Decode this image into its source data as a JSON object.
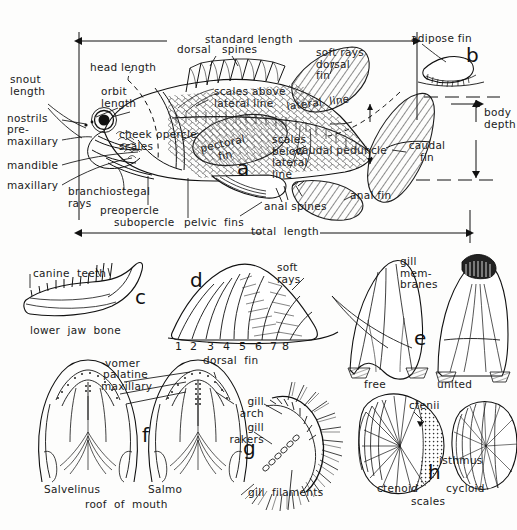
{
  "figure": {
    "ink_color": "#111111",
    "background_color": "#fdfdfc"
  },
  "panel_a": {
    "letter": "a",
    "measurements": [
      {
        "name": "standard-length",
        "label": "standard length"
      },
      {
        "name": "total-length",
        "label": "total  length"
      },
      {
        "name": "body-depth",
        "label": "body\ndepth"
      },
      {
        "name": "head-length",
        "label": "head length"
      },
      {
        "name": "snout-length",
        "label": "snout\nlength"
      },
      {
        "name": "orbit-length",
        "label": "orbit\nlength"
      }
    ],
    "labels": [
      {
        "name": "dorsal-spines",
        "label": "dorsal   spines"
      },
      {
        "name": "soft-rays-dorsal-fin",
        "label": "soft rays\ndorsal\nfin"
      },
      {
        "name": "adipose-fin",
        "label": "adipose fin"
      },
      {
        "name": "scales-above-lateral-line",
        "label": "scales above\nlateral line"
      },
      {
        "name": "lateral-line",
        "label": "lateral  line"
      },
      {
        "name": "scales-below-lateral-line",
        "label": "scales\nbelow\nlateral\nline"
      },
      {
        "name": "caudal-peduncle",
        "label": "caudal peduncle"
      },
      {
        "name": "caudal-fin",
        "label": "caudal\nfin"
      },
      {
        "name": "anal-fin",
        "label": "anal fin"
      },
      {
        "name": "anal-spines",
        "label": "anal spines"
      },
      {
        "name": "pelvic-fins",
        "label": "pelvic  fins"
      },
      {
        "name": "pectoral-fin",
        "label": "pectoral\nfin"
      },
      {
        "name": "nostrils",
        "label": "nostrils"
      },
      {
        "name": "premaxillary",
        "label": "pre-\nmaxillary"
      },
      {
        "name": "mandible",
        "label": "mandible"
      },
      {
        "name": "maxillary",
        "label": "maxillary"
      },
      {
        "name": "branchiostegal-rays",
        "label": "branchiostegal\nrays"
      },
      {
        "name": "preopercle",
        "label": "preopercle"
      },
      {
        "name": "subopercle",
        "label": "subopercle"
      },
      {
        "name": "cheek-scales",
        "label": "cheek\nscales"
      },
      {
        "name": "opercle",
        "label": "opercle"
      }
    ]
  },
  "panel_b": {
    "letter": "b",
    "subject": "adipose fin"
  },
  "panel_c": {
    "letter": "c",
    "labels": [
      {
        "name": "canine-teeth",
        "label": "canine  teeth"
      },
      {
        "name": "lower-jaw-bone",
        "label": "lower  jaw  bone"
      }
    ]
  },
  "panel_d": {
    "letter": "d",
    "labels": [
      {
        "name": "soft-rays",
        "label": "soft\nrays"
      },
      {
        "name": "dorsal-fin",
        "label": "dorsal  fin"
      }
    ],
    "ray_numbers": [
      "1",
      "2",
      "3",
      "4",
      "5",
      "6",
      "7",
      "8"
    ]
  },
  "panel_e": {
    "letter": "e",
    "labels": [
      {
        "name": "gill-membranes",
        "label": "gill\nmem-\nbranes"
      },
      {
        "name": "isthmus",
        "label": "isthmus"
      },
      {
        "name": "free",
        "label": "free"
      },
      {
        "name": "united",
        "label": "united"
      }
    ]
  },
  "panel_f": {
    "letter": "f",
    "labels": [
      {
        "name": "vomer",
        "label": "vomer"
      },
      {
        "name": "palatine",
        "label": "palatine"
      },
      {
        "name": "maxillary",
        "label": "maxillary"
      },
      {
        "name": "salvelinus",
        "label": "Salvelinus"
      },
      {
        "name": "salmo",
        "label": "Salmo"
      },
      {
        "name": "roof-of-mouth",
        "label": "roof  of  mouth"
      }
    ]
  },
  "panel_g": {
    "letter": "g",
    "labels": [
      {
        "name": "gill-arch",
        "label": "gill\narch"
      },
      {
        "name": "gill-rakers",
        "label": "gill\nrakers"
      },
      {
        "name": "gill-filaments",
        "label": "gill  filaments"
      }
    ]
  },
  "panel_h": {
    "letter": "h",
    "labels": [
      {
        "name": "ctenii",
        "label": "ctenii"
      },
      {
        "name": "ctenoid",
        "label": "ctenoid"
      },
      {
        "name": "cycloid",
        "label": "cycloid"
      },
      {
        "name": "scales",
        "label": "scales"
      }
    ]
  }
}
